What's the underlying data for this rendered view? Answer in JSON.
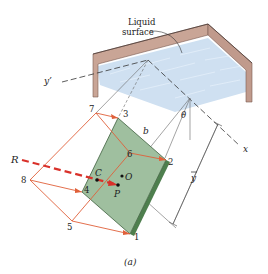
{
  "figure": {
    "caption": "(a)",
    "labels": {
      "liquid_surface_line1": "Liquid",
      "liquid_surface_line2": "surface",
      "y_prime": "y’",
      "x_axis": "x",
      "theta": "θ",
      "b": "b",
      "y_bar": "y",
      "R": "R",
      "C": "C",
      "O": "O",
      "P": "P",
      "p1": "1",
      "p2": "2",
      "p3": "3",
      "p4": "4",
      "p5": "5",
      "p6": "6",
      "p7": "7",
      "p8": "8"
    },
    "colors": {
      "plate_face": "#9fbf9f",
      "plate_edge": "#4e7f4e",
      "liquid": "#c6dbef",
      "tank_wall": "#c9a596",
      "force_lines": "#e0603a",
      "resultant": "#d9312a",
      "construction_lines": "#555555"
    }
  }
}
